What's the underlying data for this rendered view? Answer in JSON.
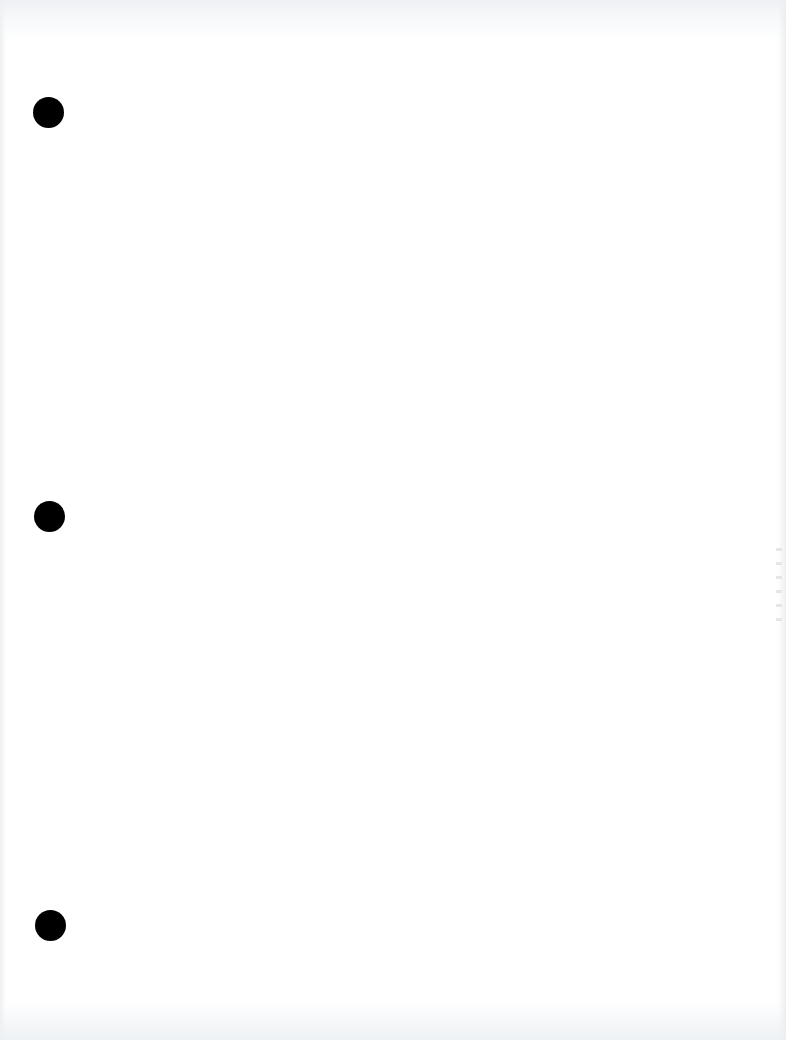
{
  "document": {
    "type": "blank-scanned-page",
    "text_content": "",
    "background_color": "#ffffff",
    "edge_tint_color": "#eef1f5",
    "punch_holes": [
      {
        "cx": 48,
        "cy": 112,
        "diameter": 31,
        "color": "#000000"
      },
      {
        "cx": 49,
        "cy": 516,
        "diameter": 31,
        "color": "#000000"
      },
      {
        "cx": 50,
        "cy": 925,
        "diameter": 31,
        "color": "#000000"
      }
    ]
  }
}
